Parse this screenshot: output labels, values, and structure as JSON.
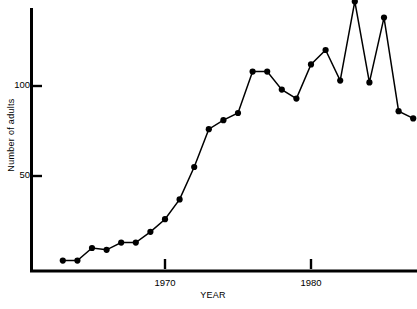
{
  "chart_data": {
    "type": "line",
    "title": "",
    "subtitle": "",
    "xlabel": "YEAR",
    "ylabel": "Number of adults",
    "xlim": [
      1962.2,
      1987.8
    ],
    "ylim": [
      0,
      152
    ],
    "grid": false,
    "legend": null,
    "markers": "filled-circle",
    "x_ticks": [
      1970,
      1980
    ],
    "x_tick_labels": [
      "1970",
      "1980"
    ],
    "y_ticks": [
      50,
      100
    ],
    "y_tick_labels": [
      "50",
      "100"
    ],
    "x": [
      1963,
      1964,
      1965,
      1966,
      1967,
      1968,
      1969,
      1970,
      1971,
      1972,
      1973,
      1974,
      1975,
      1976,
      1977,
      1978,
      1979,
      1980,
      1981,
      1982,
      1983,
      1984,
      1985,
      1986,
      1987
    ],
    "values": [
      3,
      3,
      10,
      9,
      13,
      13,
      19,
      26,
      37,
      55,
      76,
      81,
      85,
      108,
      108,
      98,
      93,
      112,
      120,
      103,
      147,
      102,
      138,
      86,
      82
    ],
    "series": [
      {
        "name": "Number of adults",
        "values": [
          3,
          3,
          10,
          9,
          13,
          13,
          19,
          26,
          37,
          55,
          76,
          81,
          85,
          108,
          108,
          98,
          93,
          112,
          120,
          103,
          147,
          102,
          138,
          86,
          82
        ]
      }
    ],
    "annotations": [],
    "colors": {
      "line": "#000000",
      "marker": "#000000",
      "axis": "#000000",
      "background": "#ffffff"
    }
  },
  "axes": {
    "y_axis_title": "Number of adults",
    "x_axis_title": "YEAR",
    "y_tick_100": "100",
    "y_tick_50": "50",
    "x_tick_1970": "1970",
    "x_tick_1980": "1980"
  }
}
